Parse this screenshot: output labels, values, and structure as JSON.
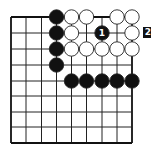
{
  "diagram": {
    "type": "go-board-fragment",
    "grid": {
      "columns": 9,
      "rows": 9,
      "x_positions": [
        11,
        26,
        41.5,
        56.5,
        71.5,
        86.5,
        102,
        117,
        132
      ],
      "y_positions": [
        17,
        33,
        49,
        65,
        81,
        96,
        112,
        127,
        143
      ],
      "line_color": "#222222",
      "border_color": "#111111"
    },
    "stones": [
      {
        "color": "black",
        "col": 3,
        "row": 0
      },
      {
        "color": "white",
        "col": 4,
        "row": 0
      },
      {
        "color": "white",
        "col": 5,
        "row": 0
      },
      {
        "color": "white",
        "col": 7,
        "row": 0
      },
      {
        "color": "white",
        "col": 8,
        "row": 0
      },
      {
        "color": "black",
        "col": 3,
        "row": 1
      },
      {
        "color": "white",
        "col": 4,
        "row": 1
      },
      {
        "color": "black",
        "col": 6,
        "row": 1,
        "label": "1"
      },
      {
        "color": "white",
        "col": 8,
        "row": 1
      },
      {
        "color": "black",
        "col": 3,
        "row": 2
      },
      {
        "color": "white",
        "col": 4,
        "row": 2
      },
      {
        "color": "white",
        "col": 5,
        "row": 2
      },
      {
        "color": "white",
        "col": 6,
        "row": 2
      },
      {
        "color": "white",
        "col": 7,
        "row": 2
      },
      {
        "color": "white",
        "col": 8,
        "row": 2
      },
      {
        "color": "black",
        "col": 3,
        "row": 3
      },
      {
        "color": "black",
        "col": 4,
        "row": 4
      },
      {
        "color": "black",
        "col": 5,
        "row": 4
      },
      {
        "color": "black",
        "col": 6,
        "row": 4
      },
      {
        "color": "black",
        "col": 7,
        "row": 4
      },
      {
        "color": "black",
        "col": 8,
        "row": 4
      }
    ],
    "offboard_label": {
      "text": "2",
      "row": 1,
      "style": "white-on-black-box"
    },
    "colors": {
      "black_stone": "#111111",
      "white_stone": "#ffffff",
      "stone_outline": "#222222",
      "label_on_black": "#ffffff"
    }
  }
}
